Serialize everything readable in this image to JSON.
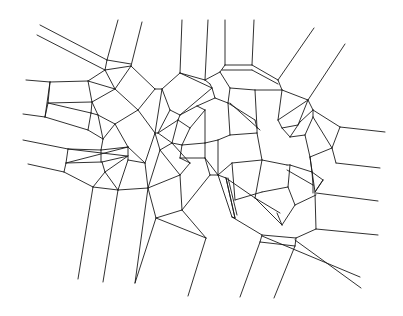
{
  "diagram": {
    "type": "voronoi-mesh",
    "stroke_color": "#1a1a1a",
    "background": "#ffffff",
    "segments": [
      [
        40,
        25,
        107,
        60
      ],
      [
        37,
        35,
        105,
        70
      ],
      [
        107,
        60,
        131,
        64
      ],
      [
        105,
        70,
        131,
        66
      ],
      [
        107,
        60,
        105,
        70
      ],
      [
        118,
        20,
        107,
        60
      ],
      [
        142,
        22,
        131,
        66
      ],
      [
        105,
        70,
        88,
        81
      ],
      [
        131,
        66,
        155,
        89
      ],
      [
        131,
        66,
        115,
        89
      ],
      [
        105,
        70,
        115,
        89
      ],
      [
        26,
        80,
        50,
        82
      ],
      [
        50,
        82,
        88,
        81
      ],
      [
        88,
        81,
        92,
        102
      ],
      [
        50,
        82,
        45,
        117
      ],
      [
        45,
        117,
        23,
        114
      ],
      [
        50,
        82,
        48,
        103
      ],
      [
        48,
        103,
        92,
        102
      ],
      [
        48,
        103,
        91,
        113
      ],
      [
        92,
        102,
        91,
        113
      ],
      [
        91,
        113,
        88,
        130
      ],
      [
        48,
        103,
        45,
        117
      ],
      [
        45,
        117,
        88,
        130
      ],
      [
        88,
        81,
        115,
        89
      ],
      [
        115,
        89,
        92,
        102
      ],
      [
        115,
        89,
        138,
        110
      ],
      [
        155,
        89,
        138,
        110
      ],
      [
        155,
        89,
        162,
        89
      ],
      [
        92,
        102,
        98,
        115
      ],
      [
        98,
        115,
        91,
        113
      ],
      [
        98,
        115,
        115,
        124
      ],
      [
        138,
        110,
        115,
        124
      ],
      [
        115,
        124,
        128,
        147
      ],
      [
        138,
        110,
        155,
        133
      ],
      [
        88,
        130,
        103,
        139
      ],
      [
        98,
        115,
        103,
        139
      ],
      [
        103,
        139,
        115,
        124
      ],
      [
        103,
        139,
        101,
        150
      ],
      [
        23,
        140,
        68,
        149
      ],
      [
        68,
        149,
        101,
        150
      ],
      [
        68,
        149,
        66,
        163
      ],
      [
        28,
        164,
        64,
        172
      ],
      [
        64,
        172,
        66,
        163
      ],
      [
        66,
        163,
        102,
        162
      ],
      [
        68,
        149,
        127,
        156
      ],
      [
        66,
        163,
        128,
        147
      ],
      [
        101,
        150,
        101,
        162
      ],
      [
        101,
        150,
        128,
        147
      ],
      [
        102,
        162,
        128,
        156
      ],
      [
        102,
        162,
        105,
        172
      ],
      [
        64,
        172,
        93,
        187
      ],
      [
        105,
        172,
        93,
        187
      ],
      [
        105,
        172,
        128,
        156
      ],
      [
        93,
        187,
        118,
        190
      ],
      [
        105,
        172,
        118,
        190
      ],
      [
        118,
        190,
        128,
        160
      ],
      [
        128,
        160,
        128,
        147
      ],
      [
        128,
        160,
        145,
        163
      ],
      [
        128,
        147,
        145,
        163
      ],
      [
        93,
        187,
        78,
        279
      ],
      [
        118,
        190,
        103,
        282
      ],
      [
        145,
        163,
        148,
        188
      ],
      [
        148,
        188,
        135,
        283
      ],
      [
        148,
        188,
        118,
        190
      ],
      [
        155,
        133,
        145,
        163
      ],
      [
        155,
        133,
        162,
        89
      ],
      [
        162,
        89,
        170,
        110
      ],
      [
        170,
        110,
        158,
        133
      ],
      [
        158,
        133,
        155,
        133
      ],
      [
        180,
        73,
        162,
        89
      ],
      [
        180,
        73,
        205,
        80
      ],
      [
        180,
        73,
        212,
        88
      ],
      [
        205,
        80,
        210,
        84
      ],
      [
        212,
        88,
        210,
        84
      ],
      [
        182,
        20,
        180,
        73
      ],
      [
        208,
        20,
        205,
        80
      ],
      [
        170,
        110,
        180,
        115
      ],
      [
        180,
        115,
        212,
        88
      ],
      [
        180,
        115,
        197,
        106
      ],
      [
        197,
        106,
        215,
        98
      ],
      [
        215,
        98,
        212,
        88
      ],
      [
        158,
        133,
        178,
        120
      ],
      [
        178,
        120,
        180,
        115
      ],
      [
        158,
        133,
        172,
        143
      ],
      [
        172,
        143,
        178,
        120
      ],
      [
        172,
        143,
        160,
        150
      ],
      [
        155,
        133,
        160,
        150
      ],
      [
        148,
        188,
        160,
        150
      ],
      [
        148,
        188,
        180,
        175
      ],
      [
        160,
        150,
        180,
        175
      ],
      [
        172,
        143,
        190,
        163
      ],
      [
        180,
        175,
        190,
        163
      ],
      [
        178,
        120,
        190,
        128
      ],
      [
        190,
        128,
        205,
        110
      ],
      [
        205,
        110,
        197,
        106
      ],
      [
        190,
        128,
        182,
        145
      ],
      [
        182,
        145,
        172,
        143
      ],
      [
        182,
        145,
        205,
        143
      ],
      [
        205,
        143,
        205,
        110
      ],
      [
        182,
        145,
        180,
        158
      ],
      [
        180,
        158,
        205,
        158
      ],
      [
        205,
        158,
        205,
        143
      ],
      [
        180,
        158,
        190,
        163
      ],
      [
        180,
        175,
        182,
        210
      ],
      [
        182,
        210,
        156,
        218
      ],
      [
        156,
        218,
        148,
        188
      ],
      [
        182,
        210,
        206,
        238
      ],
      [
        156,
        218,
        206,
        238
      ],
      [
        206,
        238,
        188,
        296
      ],
      [
        156,
        218,
        135,
        283
      ],
      [
        205,
        80,
        220,
        72
      ],
      [
        220,
        72,
        225,
        65
      ],
      [
        225,
        20,
        225,
        65
      ],
      [
        254,
        20,
        252,
        65
      ],
      [
        225,
        65,
        252,
        65
      ],
      [
        222,
        70,
        252,
        70
      ],
      [
        220,
        72,
        230,
        88
      ],
      [
        252,
        65,
        278,
        80
      ],
      [
        252,
        70,
        278,
        84
      ],
      [
        278,
        80,
        282,
        90
      ],
      [
        230,
        88,
        255,
        90
      ],
      [
        255,
        90,
        282,
        90
      ],
      [
        230,
        88,
        228,
        103
      ],
      [
        255,
        90,
        257,
        128
      ],
      [
        215,
        98,
        228,
        103
      ],
      [
        228,
        103,
        230,
        135
      ],
      [
        230,
        135,
        218,
        140
      ],
      [
        218,
        140,
        205,
        143
      ],
      [
        228,
        103,
        255,
        120
      ],
      [
        255,
        120,
        257,
        128
      ],
      [
        230,
        103,
        260,
        130
      ],
      [
        230,
        135,
        257,
        133
      ],
      [
        257,
        128,
        257,
        133
      ],
      [
        257,
        133,
        262,
        160
      ],
      [
        218,
        140,
        218,
        175
      ],
      [
        205,
        158,
        218,
        175
      ],
      [
        218,
        175,
        232,
        163
      ],
      [
        232,
        163,
        262,
        160
      ],
      [
        232,
        163,
        235,
        200
      ],
      [
        205,
        158,
        210,
        175
      ],
      [
        210,
        175,
        218,
        175
      ],
      [
        218,
        175,
        226,
        178
      ],
      [
        226,
        178,
        235,
        218
      ],
      [
        228,
        178,
        237,
        215
      ],
      [
        235,
        218,
        226,
        178
      ],
      [
        218,
        175,
        232,
        217
      ],
      [
        232,
        217,
        235,
        218
      ],
      [
        210,
        175,
        182,
        210
      ],
      [
        226,
        178,
        255,
        198
      ],
      [
        255,
        198,
        280,
        213
      ],
      [
        262,
        160,
        255,
        198
      ],
      [
        262,
        160,
        287,
        165
      ],
      [
        287,
        165,
        290,
        165
      ],
      [
        282,
        90,
        308,
        100
      ],
      [
        282,
        90,
        278,
        120
      ],
      [
        278,
        120,
        308,
        100
      ],
      [
        278,
        120,
        282,
        128
      ],
      [
        282,
        128,
        298,
        125
      ],
      [
        298,
        125,
        308,
        100
      ],
      [
        314,
        28,
        278,
        80
      ],
      [
        345,
        44,
        308,
        100
      ],
      [
        308,
        100,
        313,
        110
      ],
      [
        313,
        110,
        300,
        122
      ],
      [
        313,
        110,
        340,
        127
      ],
      [
        300,
        122,
        290,
        137
      ],
      [
        290,
        137,
        282,
        128
      ],
      [
        290,
        137,
        305,
        135
      ],
      [
        305,
        135,
        313,
        117
      ],
      [
        313,
        117,
        313,
        110
      ],
      [
        340,
        127,
        385,
        132
      ],
      [
        340,
        127,
        332,
        148
      ],
      [
        332,
        148,
        313,
        117
      ],
      [
        305,
        135,
        310,
        157
      ],
      [
        310,
        157,
        332,
        148
      ],
      [
        332,
        148,
        336,
        163
      ],
      [
        336,
        163,
        380,
        168
      ],
      [
        310,
        157,
        312,
        172
      ],
      [
        312,
        172,
        290,
        165
      ],
      [
        312,
        172,
        313,
        185
      ],
      [
        313,
        185,
        287,
        170
      ],
      [
        312,
        172,
        323,
        180
      ],
      [
        323,
        180,
        315,
        192
      ],
      [
        315,
        192,
        310,
        157
      ],
      [
        313,
        185,
        313,
        193
      ],
      [
        290,
        165,
        288,
        187
      ],
      [
        288,
        187,
        262,
        192
      ],
      [
        262,
        192,
        235,
        200
      ],
      [
        288,
        187,
        295,
        205
      ],
      [
        295,
        205,
        282,
        225
      ],
      [
        282,
        225,
        255,
        198
      ],
      [
        315,
        192,
        323,
        180
      ],
      [
        315,
        193,
        316,
        229
      ],
      [
        316,
        229,
        378,
        235
      ],
      [
        316,
        193,
        378,
        201
      ],
      [
        295,
        205,
        316,
        195
      ],
      [
        316,
        229,
        296,
        238
      ],
      [
        296,
        238,
        262,
        235
      ],
      [
        262,
        235,
        232,
        217
      ],
      [
        282,
        225,
        277,
        213
      ],
      [
        262,
        235,
        260,
        242
      ],
      [
        296,
        238,
        295,
        246
      ],
      [
        260,
        242,
        295,
        246
      ],
      [
        260,
        242,
        240,
        297
      ],
      [
        295,
        246,
        274,
        298
      ],
      [
        262,
        236,
        360,
        277
      ],
      [
        295,
        240,
        361,
        288
      ]
    ]
  }
}
